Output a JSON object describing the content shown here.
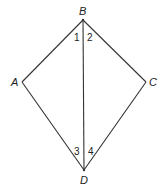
{
  "diagram": {
    "type": "kite-quadrilateral",
    "vertices": [
      {
        "id": "B",
        "label": "B",
        "x": 83,
        "y": 20
      },
      {
        "id": "A",
        "label": "A",
        "x": 22,
        "y": 82
      },
      {
        "id": "C",
        "label": "C",
        "x": 146,
        "y": 82
      },
      {
        "id": "D",
        "label": "D",
        "x": 84,
        "y": 170
      }
    ],
    "edges": [
      [
        "B",
        "A"
      ],
      [
        "A",
        "D"
      ],
      [
        "D",
        "C"
      ],
      [
        "C",
        "B"
      ],
      [
        "B",
        "D"
      ]
    ],
    "angles": [
      {
        "label": "1",
        "at": "B",
        "side": "left"
      },
      {
        "label": "2",
        "at": "B",
        "side": "right"
      },
      {
        "label": "3",
        "at": "D",
        "side": "left"
      },
      {
        "label": "4",
        "at": "D",
        "side": "right"
      }
    ],
    "line_color": "#333333"
  }
}
